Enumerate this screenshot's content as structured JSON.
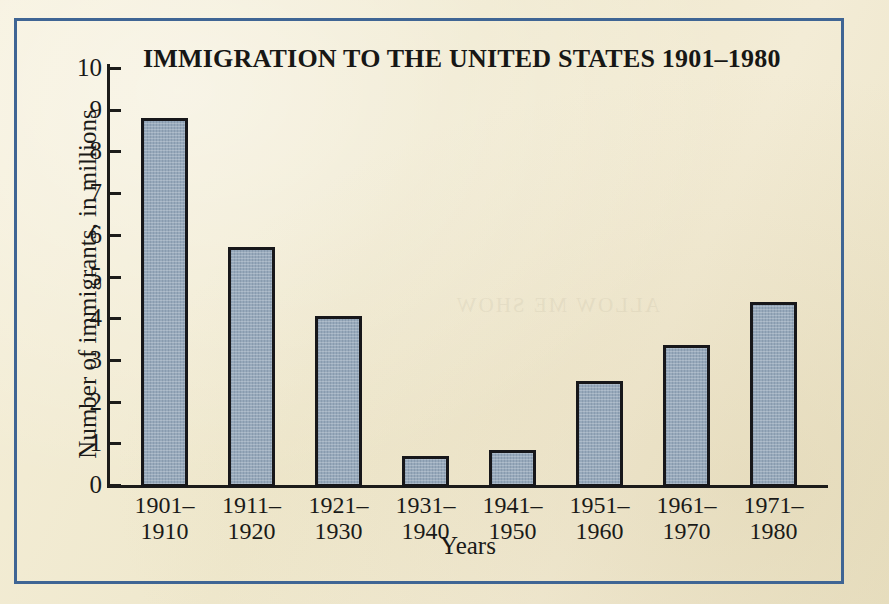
{
  "figure": {
    "border_color": "#3f6594",
    "paper_color": "#f2ecd4",
    "bar_fill_color": "#97a9bb",
    "bar_edge_color": "#17171a"
  },
  "chart_data": {
    "type": "bar",
    "title": "IMMIGRATION TO THE UNITED STATES 1901–1980",
    "xlabel": "Years",
    "ylabel": "Number of immigrants, in millions",
    "categories": [
      "1901–\n1910",
      "1911–\n1920",
      "1921–\n1930",
      "1931–\n1940",
      "1941–\n1950",
      "1951–\n1960",
      "1961–\n1970",
      "1971–\n1980"
    ],
    "values": [
      8.8,
      5.7,
      4.05,
      0.7,
      0.85,
      2.5,
      3.35,
      4.4
    ],
    "ylim": [
      0,
      10
    ],
    "ytick_labels": [
      "0",
      "1",
      "2",
      "3",
      "4",
      "5",
      "6",
      "7",
      "8",
      "9",
      "10"
    ],
    "ytick_values": [
      0,
      1,
      2,
      3,
      4,
      5,
      6,
      7,
      8,
      9,
      10
    ],
    "grid": false,
    "legend": null
  },
  "show_through_text": "ALLOW ME SHOW"
}
